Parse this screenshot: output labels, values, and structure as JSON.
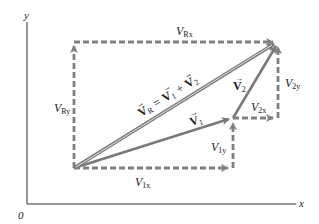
{
  "colors": {
    "axis": "#333333",
    "vector": "#7a7a7a",
    "dashed": "#808080",
    "text": "#222222",
    "background": "#ffffff"
  },
  "axes": {
    "x_label": "x",
    "y_label": "y",
    "origin_label": "0"
  },
  "labels": {
    "VRx": {
      "main": "V",
      "sub": "Rx"
    },
    "VRy": {
      "main": "V",
      "sub": "Ry"
    },
    "V1x": {
      "main": "V",
      "sub": "1x"
    },
    "V1y": {
      "main": "V",
      "sub": "1y"
    },
    "V2x": {
      "main": "V",
      "sub": "2x"
    },
    "V2y": {
      "main": "V",
      "sub": "2y"
    },
    "V1": {
      "main": "V",
      "sub": "1"
    },
    "V2": {
      "main": "V",
      "sub": "2"
    },
    "VR_equation": {
      "text": "V",
      "sub_r": "R",
      "eq": " = ",
      "v1": "V",
      "sub1": "1",
      "plus": " + ",
      "v2": "V",
      "sub2": "2"
    }
  },
  "geometry": {
    "tail": [
      74,
      168
    ],
    "v1_tip": [
      233,
      118
    ],
    "resultant_tip": [
      278,
      42
    ],
    "corner_top_left": [
      74,
      42
    ]
  }
}
